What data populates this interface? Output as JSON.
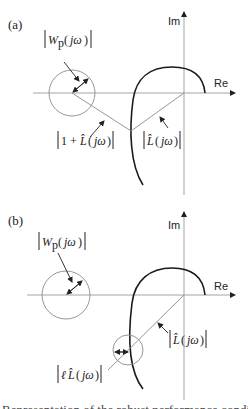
{
  "panels": [
    {
      "id": "a",
      "label": "(a)",
      "axes": {
        "real_label": "Re",
        "imag_label": "Im"
      },
      "annotations": {
        "wp": {
          "bar_open": "|",
          "W": "W",
          "sub": "p",
          "paren_open": "(",
          "arg": "jω",
          "paren_close": ")",
          "bar_close": "|"
        },
        "one_plus_l": {
          "text": "|1 + L̂(jω)|",
          "one_plus": "1 + ",
          "L": "L̂",
          "arg": "jω"
        },
        "l_hat": {
          "L": "L̂",
          "arg": "jω"
        }
      }
    },
    {
      "id": "b",
      "label": "(b)",
      "axes": {
        "real_label": "Re",
        "imag_label": "Im"
      },
      "annotations": {
        "wp": {
          "W": "W",
          "sub": "p",
          "arg": "jω"
        },
        "l_hat": {
          "L": "L̂",
          "arg": "jω"
        },
        "ell_l_hat": {
          "ell": "ℓ",
          "L": "L̂",
          "arg": "jω"
        }
      }
    }
  ],
  "caption_fragment": "Representation of the robust performance condition"
}
